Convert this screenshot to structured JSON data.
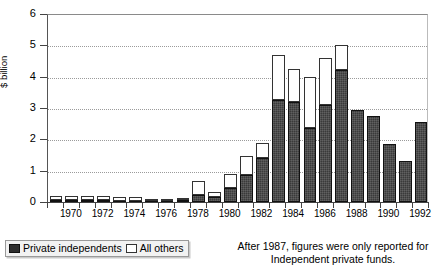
{
  "axes": {
    "y_title": "$ billion",
    "y_ticks": [
      "0",
      "1",
      "2",
      "3",
      "4",
      "5",
      "6"
    ],
    "x_ticks": [
      "1970",
      "1972",
      "1974",
      "1976",
      "1978",
      "1980",
      "1982",
      "1984",
      "1986",
      "1988",
      "1990",
      "1992"
    ]
  },
  "legend": {
    "items": [
      {
        "label": "Private independents",
        "swatch": "dark-filled-swatch",
        "color": "#2e2e2e"
      },
      {
        "label": "All others",
        "swatch": "white-open-swatch",
        "color": "#ffffff"
      }
    ]
  },
  "footnote": {
    "line1": "After 1987, figures were only reported for",
    "line2": "Independent private funds."
  },
  "chart_data": {
    "type": "bar",
    "stacked": true,
    "title": "",
    "xlabel": "",
    "ylabel": "$ billion",
    "ylim": [
      0,
      6
    ],
    "grid": true,
    "legend_position": "bottom-left",
    "annotation": "After 1987, figures were only reported for Independent private funds.",
    "categories": [
      "1969",
      "1970",
      "1971",
      "1972",
      "1973",
      "1974",
      "1975",
      "1976",
      "1977",
      "1978",
      "1979",
      "1980",
      "1981",
      "1982",
      "1983",
      "1984",
      "1985",
      "1986",
      "1987",
      "1988",
      "1989",
      "1990",
      "1991",
      "1992"
    ],
    "series": [
      {
        "name": "Private independents",
        "values": [
          0.07,
          0.05,
          0.05,
          0.05,
          0.04,
          0.03,
          0.01,
          0.02,
          0.06,
          0.22,
          0.17,
          0.44,
          0.87,
          1.42,
          3.25,
          3.2,
          2.35,
          3.1,
          4.2,
          2.95,
          2.75,
          1.85,
          1.3,
          2.55
        ]
      },
      {
        "name": "All others",
        "values": [
          0.13,
          0.13,
          0.13,
          0.13,
          0.12,
          0.1,
          0.04,
          0.03,
          0.06,
          0.45,
          0.16,
          0.46,
          0.6,
          0.46,
          1.45,
          1.05,
          1.65,
          1.5,
          0.8,
          0.0,
          0.0,
          0.0,
          0.0,
          0.0
        ]
      }
    ],
    "totals": [
      0.2,
      0.18,
      0.18,
      0.18,
      0.16,
      0.13,
      0.05,
      0.05,
      0.12,
      0.67,
      0.33,
      0.9,
      1.47,
      1.88,
      4.7,
      4.25,
      4.0,
      4.6,
      5.0,
      2.95,
      2.75,
      1.85,
      1.3,
      2.55
    ]
  }
}
